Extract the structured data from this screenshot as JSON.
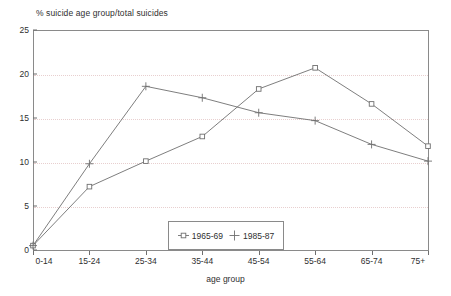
{
  "chart_data": {
    "type": "line",
    "title": "% suicide age group/total suicides",
    "xlabel": "age group",
    "ylabel": "",
    "categories": [
      "0-14",
      "15-24",
      "25-34",
      "35-44",
      "45-54",
      "55-64",
      "65-74",
      "75+"
    ],
    "ylim": [
      0,
      25
    ],
    "yticks": [
      0,
      5,
      10,
      15,
      20,
      25
    ],
    "ytick_labels": [
      "0",
      "5",
      "10",
      "15",
      "20",
      "25"
    ],
    "grid": true,
    "legend_position": "bottom-center",
    "series": [
      {
        "name": "1965-69",
        "marker": "square",
        "values": [
          0.5,
          7.2,
          10.1,
          12.9,
          18.3,
          20.7,
          16.6,
          11.8
        ]
      },
      {
        "name": "1985-87",
        "marker": "plus",
        "values": [
          0.5,
          9.8,
          18.6,
          17.3,
          15.6,
          14.7,
          12.0,
          10.1
        ]
      }
    ],
    "colors": {
      "line": "#6f6f6f",
      "grid": "#e8cfcf",
      "axis": "#8a8a8a",
      "text": "#2f2f2f"
    }
  },
  "legend": {
    "entries": [
      {
        "label": "1965-69"
      },
      {
        "label": "1985-87"
      }
    ]
  }
}
